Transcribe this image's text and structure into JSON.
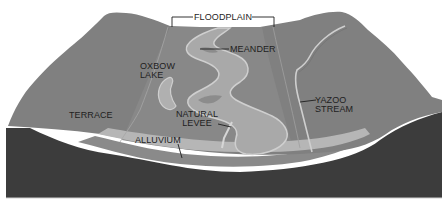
{
  "diagram": {
    "type": "block-diagram cross-section",
    "colors": {
      "background": "#ffffff",
      "bedrock": "#3c3c3c",
      "surface": "#7e7e7e",
      "floodplain_surface": "#878787",
      "alluvium_light": "#b4b4b4",
      "alluvium_mid": "#9a9a9a",
      "channel": "#a8a8a8",
      "channel_edge": "#cfcfcf",
      "label_text": "#1e1e1e"
    },
    "labels": {
      "floodplain": "FLOODPLAIN",
      "meander": "MEANDER",
      "oxbow_lake_line1": "OXBOW",
      "oxbow_lake_line2": "LAKE",
      "terrace": "TERRACE",
      "natural_levee_line1": "NATURAL",
      "natural_levee_line2": "LEVEE",
      "alluvium": "ALLUVIUM",
      "yazoo_stream_line1": "YAZOO",
      "yazoo_stream_line2": "STREAM"
    }
  }
}
